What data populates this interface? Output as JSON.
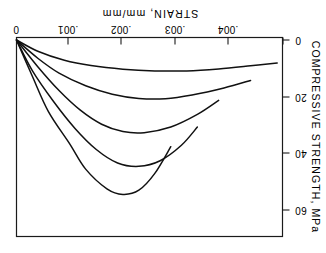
{
  "chart_data": {
    "type": "line",
    "title": "",
    "orientation_note": "figure printed rotated 180 degrees",
    "xlabel": "STRAIN, mm/mm",
    "ylabel": "COMPRESSIVE STRENGTH, MPa",
    "x_ticks": [
      0,
      0.001,
      0.002,
      0.003,
      0.004
    ],
    "x_tick_labels": [
      "0",
      ".001",
      ".002",
      ".003",
      ".004"
    ],
    "y_ticks": [
      0,
      20,
      40,
      60
    ],
    "y_tick_labels": [
      "0",
      "20",
      "40",
      "60"
    ],
    "xlim": [
      0,
      0.005
    ],
    "ylim": [
      0,
      70
    ],
    "grid": false,
    "legend": null,
    "x_axis_position": "top",
    "y_axis_position": "right",
    "x_direction": "increasing-leftward",
    "y_direction": "increasing-downward",
    "series": [
      {
        "name": "curve-1",
        "peak_strength": 11,
        "strain_at_peak": 0.0032,
        "points": [
          {
            "strain": 0.0,
            "stress": 0
          },
          {
            "strain": 0.0004,
            "stress": 4.0
          },
          {
            "strain": 0.0009,
            "stress": 7.2
          },
          {
            "strain": 0.0014,
            "stress": 9.1
          },
          {
            "strain": 0.002,
            "stress": 10.4
          },
          {
            "strain": 0.0026,
            "stress": 11.0
          },
          {
            "strain": 0.0032,
            "stress": 11.0
          },
          {
            "strain": 0.0038,
            "stress": 10.3
          },
          {
            "strain": 0.0044,
            "stress": 9.2
          },
          {
            "strain": 0.0049,
            "stress": 8.2
          }
        ]
      },
      {
        "name": "curve-2",
        "peak_strength": 21,
        "strain_at_peak": 0.0026,
        "points": [
          {
            "strain": 0.0,
            "stress": 0
          },
          {
            "strain": 0.0004,
            "stress": 6.5
          },
          {
            "strain": 0.0008,
            "stress": 11.8
          },
          {
            "strain": 0.0013,
            "stress": 16.3
          },
          {
            "strain": 0.0018,
            "stress": 19.3
          },
          {
            "strain": 0.0023,
            "stress": 20.8
          },
          {
            "strain": 0.0028,
            "stress": 20.9
          },
          {
            "strain": 0.0033,
            "stress": 19.6
          },
          {
            "strain": 0.0039,
            "stress": 17.1
          },
          {
            "strain": 0.0044,
            "stress": 14.4
          }
        ]
      },
      {
        "name": "curve-3",
        "peak_strength": 33,
        "strain_at_peak": 0.0022,
        "points": [
          {
            "strain": 0.0,
            "stress": 0
          },
          {
            "strain": 0.0004,
            "stress": 9.5
          },
          {
            "strain": 0.0008,
            "stress": 18.0
          },
          {
            "strain": 0.0012,
            "stress": 25.0
          },
          {
            "strain": 0.0016,
            "stress": 30.0
          },
          {
            "strain": 0.002,
            "stress": 32.6
          },
          {
            "strain": 0.0024,
            "stress": 33.0
          },
          {
            "strain": 0.0029,
            "stress": 31.0
          },
          {
            "strain": 0.0034,
            "stress": 26.5
          },
          {
            "strain": 0.0038,
            "stress": 21.5
          }
        ]
      },
      {
        "name": "curve-4",
        "peak_strength": 45,
        "strain_at_peak": 0.0021,
        "points": [
          {
            "strain": 0.0,
            "stress": 0
          },
          {
            "strain": 0.0003,
            "stress": 11.0
          },
          {
            "strain": 0.0007,
            "stress": 22.0
          },
          {
            "strain": 0.0011,
            "stress": 31.5
          },
          {
            "strain": 0.0015,
            "stress": 39.0
          },
          {
            "strain": 0.0019,
            "stress": 43.8
          },
          {
            "strain": 0.0023,
            "stress": 45.0
          },
          {
            "strain": 0.0027,
            "stress": 43.0
          },
          {
            "strain": 0.0031,
            "stress": 37.5
          },
          {
            "strain": 0.0034,
            "stress": 31.0
          }
        ]
      },
      {
        "name": "curve-5",
        "peak_strength": 55,
        "strain_at_peak": 0.0019,
        "points": [
          {
            "strain": 0.0,
            "stress": 0
          },
          {
            "strain": 0.0003,
            "stress": 13.0
          },
          {
            "strain": 0.0006,
            "stress": 25.5
          },
          {
            "strain": 0.001,
            "stress": 37.0
          },
          {
            "strain": 0.0013,
            "stress": 46.0
          },
          {
            "strain": 0.0017,
            "stress": 53.0
          },
          {
            "strain": 0.002,
            "stress": 55.0
          },
          {
            "strain": 0.0023,
            "stress": 53.5
          },
          {
            "strain": 0.0026,
            "stress": 47.5
          },
          {
            "strain": 0.0029,
            "stress": 38.0
          }
        ]
      }
    ]
  },
  "colors": {
    "background": "#ffffff",
    "ink": "#111111",
    "frame": "#1a1a1a"
  }
}
